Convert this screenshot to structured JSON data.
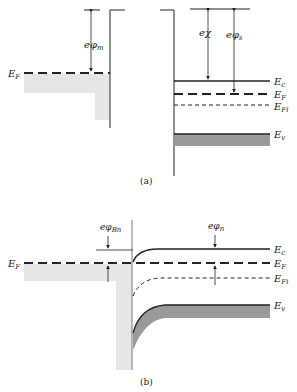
{
  "figure": {
    "panel_a": {
      "caption": "(a)",
      "metal": {
        "fermi_label": "E",
        "fermi_sub": "F",
        "work_function_label": "eφ",
        "work_function_sub": "m"
      },
      "semiconductor": {
        "electron_affinity_label": "eχ",
        "work_function_label": "eφ",
        "work_function_sub": "s",
        "levels": [
          {
            "label": "E",
            "sub": "c",
            "style": "solid"
          },
          {
            "label": "E",
            "sub": "F",
            "style": "long-dash"
          },
          {
            "label": "E",
            "sub": "Fi",
            "style": "short-dash"
          },
          {
            "label": "E",
            "sub": "v",
            "style": "solid-shaded"
          }
        ]
      }
    },
    "panel_b": {
      "caption": "(b)",
      "fermi_label": "E",
      "fermi_sub": "F",
      "barrier_label": "eφ",
      "barrier_sub": "Bn",
      "phi_n_label": "eφ",
      "phi_n_sub": "n",
      "levels": [
        {
          "label": "E",
          "sub": "c"
        },
        {
          "label": "E",
          "sub": "F"
        },
        {
          "label": "E",
          "sub": "Fi"
        },
        {
          "label": "E",
          "sub": "v"
        }
      ]
    },
    "colors": {
      "line": "#222222",
      "metal_fill": "#e6e6e6",
      "valence_fill": "#9a9a9a"
    }
  }
}
